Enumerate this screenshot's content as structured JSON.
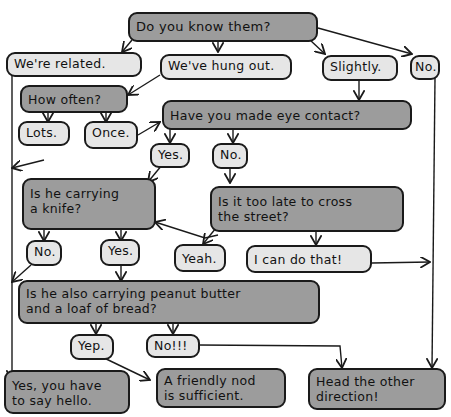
{
  "flowchart": {
    "question_1": "Do you know them?",
    "answers_1": [
      "We're related.",
      "We've hung out.",
      "Slightly.",
      "No."
    ],
    "question_how_often": "How often?",
    "answers_how_often": [
      "Lots.",
      "Once."
    ],
    "question_eye_contact": "Have you made eye contact?",
    "answers_eye_contact": [
      "Yes.",
      "No."
    ],
    "question_knife": "Is he carrying\na knife?",
    "answers_knife": [
      "No.",
      "Yes."
    ],
    "question_too_late": "Is it too late to cross\nthe street?",
    "answers_too_late": [
      "Yeah.",
      "I can do that!"
    ],
    "question_peanut": "Is he also carrying peanut butter\nand a loaf of bread?",
    "answers_peanut": [
      "Yep.",
      "No!!!"
    ],
    "outcomes": {
      "say_hello": "Yes, you have\nto say hello.",
      "friendly_nod": "A friendly nod\nis sufficient.",
      "other_direction": "Head the other\ndirection!"
    }
  },
  "colors": {
    "question_fill": "#9c9c9c",
    "answer_fill": "#e6e6e6",
    "outline": "#1a1a1a"
  }
}
